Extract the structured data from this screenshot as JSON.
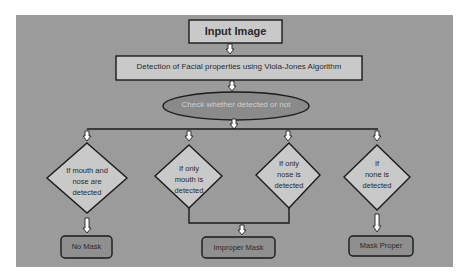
{
  "diagram": {
    "colors": {
      "background": "#ffffff",
      "panel": "#9b9b9b",
      "box_fill": "#c9c9c9",
      "ellipse_fill": "#888888",
      "border": "#1a1a1a",
      "arrow_fill": "#ffffff"
    },
    "nodes": {
      "input": {
        "label": "Input Image"
      },
      "detection": {
        "label": "Detection of Facial properties using Viola-Jones Algorithm"
      },
      "check": {
        "label": "Check whether detected or not"
      },
      "decision1": {
        "line1": "If mouth and",
        "line2": "nose are",
        "line3": "detected"
      },
      "decision2": {
        "line1": "If only",
        "line2": "mouth is",
        "line3": "detected"
      },
      "decision3": {
        "line1": "If only",
        "line2": "nose is",
        "line3": "detected"
      },
      "decision4": {
        "line1": "If",
        "line2": "none is",
        "line3": "detected"
      },
      "out_no_mask": {
        "label": "No Mask"
      },
      "out_improper": {
        "label": "Improper Mask"
      },
      "out_proper": {
        "label": "Mask Proper"
      }
    },
    "edges": [
      {
        "from": "input",
        "to": "detection"
      },
      {
        "from": "detection",
        "to": "check"
      },
      {
        "from": "check",
        "to": "decision1"
      },
      {
        "from": "check",
        "to": "decision2"
      },
      {
        "from": "check",
        "to": "decision3"
      },
      {
        "from": "check",
        "to": "decision4"
      },
      {
        "from": "decision1",
        "to": "out_no_mask"
      },
      {
        "from": "decision2",
        "to": "out_improper"
      },
      {
        "from": "decision3",
        "to": "out_improper"
      },
      {
        "from": "decision4",
        "to": "out_proper"
      }
    ]
  }
}
